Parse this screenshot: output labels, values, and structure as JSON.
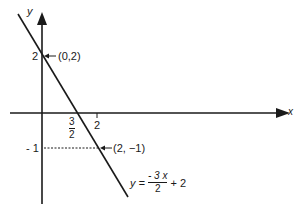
{
  "diagram": {
    "axes": {
      "x_label": "x",
      "y_label": "y"
    },
    "ticks": {
      "y_two": "2",
      "y_neg_one": "- 1",
      "x_three_num": "3",
      "x_three_den": "2",
      "x_two": "2"
    },
    "points": [
      {
        "label": "(0,2)",
        "x": 0,
        "y": 2
      },
      {
        "label": "(2, −1)",
        "x": 2,
        "y": -1
      }
    ],
    "equation": {
      "lhs": "y =",
      "numerator": "- 3 x",
      "denominator": "2",
      "tail": "+ 2"
    },
    "line": {
      "slope": -1.5,
      "intercept": 2,
      "color": "#1a1a1a"
    }
  }
}
